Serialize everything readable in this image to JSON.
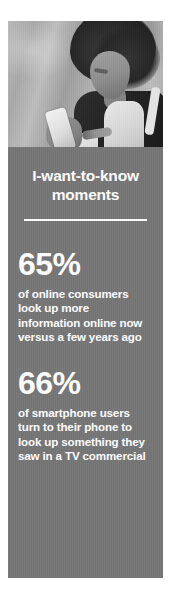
{
  "card": {
    "background_color": "#767676",
    "text_color": "#ffffff"
  },
  "photo": {
    "alt": "black and white photo of a woman with curly hair looking at a smartphone"
  },
  "title": "I-want-to-know moments",
  "stats": [
    {
      "number": "65%",
      "description_lines": [
        "of online consumers",
        "look up more",
        "information online now",
        "versus a few years ago"
      ]
    },
    {
      "number": "66%",
      "description_lines": [
        "of smartphone users",
        "turn to their phone to",
        "look up something they",
        "saw in a TV commercial"
      ]
    }
  ]
}
